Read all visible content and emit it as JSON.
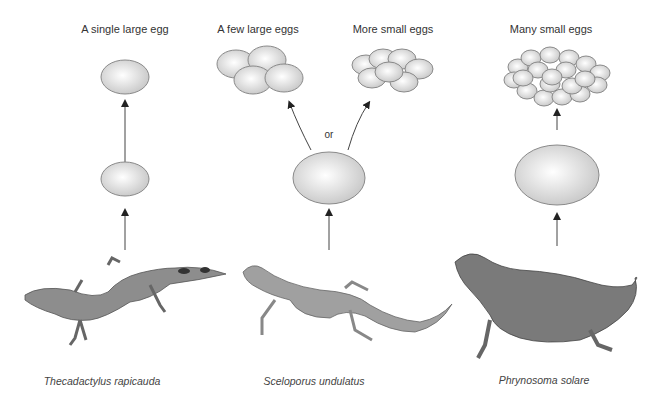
{
  "columns": [
    {
      "species": "Thecadactylus rapicauda",
      "outcomes": [
        {
          "label": "A single large egg"
        }
      ]
    },
    {
      "species": "Sceloporus undulatus",
      "connector": "or",
      "outcomes": [
        {
          "label": "A few large eggs"
        },
        {
          "label": "More small eggs"
        }
      ]
    },
    {
      "species": "Phrynosoma solare",
      "outcomes": [
        {
          "label": "Many small eggs"
        }
      ]
    }
  ],
  "colors": {
    "egg_stroke": "#8a8a8a",
    "egg_fill_light": "#ffffff",
    "egg_fill_dark": "#c8c8c8",
    "arrow": "#333333"
  }
}
